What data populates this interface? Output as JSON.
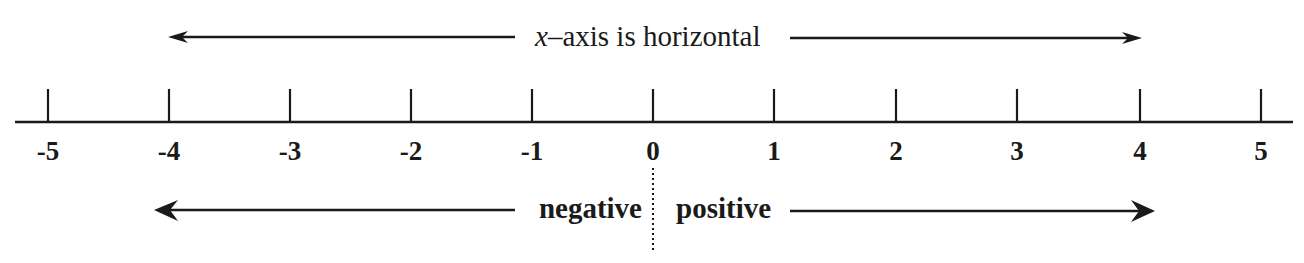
{
  "title_text": {
    "variable": "x",
    "rest": "–axis is horizontal"
  },
  "direction_labels": {
    "negative": "negative",
    "positive": "positive"
  },
  "ticks": [
    {
      "value": "-5",
      "x": 48
    },
    {
      "value": "-4",
      "x": 169
    },
    {
      "value": "-3",
      "x": 290
    },
    {
      "value": "-2",
      "x": 411
    },
    {
      "value": "-1",
      "x": 532
    },
    {
      "value": "0",
      "x": 653
    },
    {
      "value": "1",
      "x": 774
    },
    {
      "value": "2",
      "x": 896
    },
    {
      "value": "3",
      "x": 1017
    },
    {
      "value": "4",
      "x": 1140
    },
    {
      "value": "5",
      "x": 1261
    }
  ],
  "colors": {
    "line": "#1a1a1a",
    "background": "#ffffff"
  }
}
